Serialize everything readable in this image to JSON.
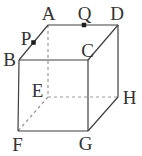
{
  "figure": {
    "type": "geometry-diagram",
    "shape": "cube",
    "background": "#ffffff",
    "solid_edge_color": "#3f3f3f",
    "dashed_edge_color": "#999999",
    "label_color": "#333333",
    "marker_color": "#1d1d1d",
    "marker_size": 4.5,
    "vertices": {
      "A": {
        "x": 48,
        "y": 25
      },
      "B": {
        "x": 19,
        "y": 60
      },
      "C": {
        "x": 88,
        "y": 60
      },
      "D": {
        "x": 118,
        "y": 25
      },
      "E": {
        "x": 48,
        "y": 97
      },
      "F": {
        "x": 18,
        "y": 131
      },
      "G": {
        "x": 88,
        "y": 131
      },
      "H": {
        "x": 118,
        "y": 97
      }
    },
    "edges": {
      "solid": [
        [
          "A",
          "B"
        ],
        [
          "A",
          "D"
        ],
        [
          "B",
          "C"
        ],
        [
          "C",
          "D"
        ],
        [
          "B",
          "F"
        ],
        [
          "C",
          "G"
        ],
        [
          "D",
          "H"
        ],
        [
          "F",
          "G"
        ],
        [
          "G",
          "H"
        ]
      ],
      "dashed": [
        [
          "A",
          "E"
        ],
        [
          "E",
          "H"
        ],
        [
          "E",
          "F"
        ]
      ]
    },
    "marked_points": [
      {
        "name": "P",
        "on_edge": "AB",
        "x": 33.5,
        "y": 42.5
      },
      {
        "name": "Q",
        "on_edge": "AD",
        "x": 84,
        "y": 25
      }
    ],
    "labels": [
      {
        "text": "A",
        "x": 48.5,
        "y": 20
      },
      {
        "text": "Q",
        "x": 84.5,
        "y": 20
      },
      {
        "text": "D",
        "x": 117,
        "y": 20
      },
      {
        "text": "P",
        "x": 26,
        "y": 45
      },
      {
        "text": "B",
        "x": 9.5,
        "y": 66
      },
      {
        "text": "C",
        "x": 87.5,
        "y": 57
      },
      {
        "text": "E",
        "x": 37.5,
        "y": 97
      },
      {
        "text": "H",
        "x": 129.5,
        "y": 104
      },
      {
        "text": "F",
        "x": 17.5,
        "y": 151
      },
      {
        "text": "G",
        "x": 85.5,
        "y": 150
      }
    ]
  }
}
